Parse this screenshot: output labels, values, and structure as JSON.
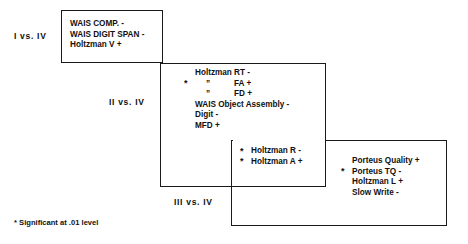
{
  "diagram": {
    "line_color": "#1a1a1a",
    "text_color": "#111111",
    "background": "#ffffff"
  },
  "groups": [
    {
      "id": "group-1",
      "label": "I  vs.  IV",
      "items": [
        {
          "star": "",
          "text": "WAIS COMP. -"
        },
        {
          "star": "",
          "text": "WAIS DIGIT SPAN -"
        },
        {
          "star": "",
          "text": "Holtzman V +"
        }
      ]
    },
    {
      "id": "group-2",
      "label": "II  vs.  IV",
      "items": [
        {
          "star": "",
          "text": "Holtzman RT -"
        },
        {
          "star": "*",
          "ditto": "”",
          "text": "FA +"
        },
        {
          "star": "",
          "ditto": "”",
          "text": "FD +"
        },
        {
          "star": "",
          "text": "WAIS Object Assembly -"
        },
        {
          "star": "",
          "text": "Digit -"
        },
        {
          "star": "",
          "text": "MFD +"
        }
      ]
    },
    {
      "id": "group-3",
      "label": "III  vs.  IV",
      "items": [
        {
          "star": "",
          "text": "Porteus Quality +"
        },
        {
          "star": "*",
          "text": "Porteus TQ -"
        },
        {
          "star": "",
          "text": "Holtzman L +"
        },
        {
          "star": "",
          "text": "Slow Write -"
        }
      ]
    }
  ],
  "overlap": {
    "id": "overlap-2-3",
    "items": [
      {
        "star": "*",
        "text": "Holtzman R -"
      },
      {
        "star": "*",
        "text": "Holtzman A +"
      }
    ]
  },
  "footnote": "* Significant at .01 level"
}
